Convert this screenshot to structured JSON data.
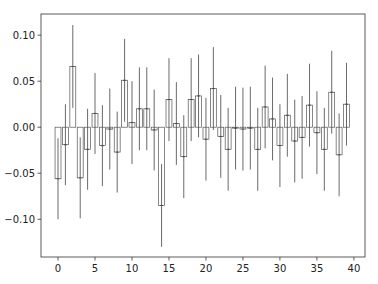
{
  "chart_data": {
    "type": "bar",
    "title": "",
    "xlabel": "",
    "ylabel": "",
    "x": [
      0,
      1,
      2,
      3,
      4,
      5,
      6,
      7,
      8,
      9,
      10,
      11,
      12,
      13,
      14,
      15,
      16,
      17,
      18,
      19,
      20,
      21,
      22,
      23,
      24,
      25,
      26,
      27,
      28,
      29,
      30,
      31,
      32,
      33,
      34,
      35,
      36,
      37,
      38,
      39
    ],
    "values": [
      -0.056,
      -0.019,
      0.066,
      -0.055,
      -0.024,
      0.015,
      -0.02,
      -0.002,
      -0.027,
      0.051,
      0.005,
      0.02,
      0.02,
      -0.003,
      -0.085,
      0.03,
      0.004,
      -0.032,
      0.03,
      0.034,
      -0.013,
      0.042,
      -0.01,
      -0.024,
      -0.001,
      -0.002,
      -0.001,
      -0.024,
      0.022,
      0.009,
      -0.02,
      0.013,
      -0.015,
      -0.011,
      0.024,
      -0.006,
      -0.024,
      0.038,
      -0.03,
      0.025
    ],
    "errors": [
      0.044,
      0.044,
      0.045,
      0.044,
      0.044,
      0.044,
      0.044,
      0.044,
      0.044,
      0.045,
      0.045,
      0.045,
      0.045,
      0.044,
      0.045,
      0.045,
      0.045,
      0.045,
      0.045,
      0.045,
      0.045,
      0.045,
      0.045,
      0.045,
      0.045,
      0.045,
      0.045,
      0.045,
      0.045,
      0.045,
      0.045,
      0.045,
      0.045,
      0.045,
      0.045,
      0.045,
      0.045,
      0.045,
      0.045,
      0.045
    ],
    "xticks": [
      0,
      5,
      10,
      15,
      20,
      25,
      30,
      35,
      40
    ],
    "yticks": [
      -0.1,
      -0.05,
      0.0,
      0.05,
      0.1
    ],
    "ytick_labels": [
      "−0.10",
      "−0.05",
      "0.00",
      "0.05",
      "0.10"
    ],
    "xlim": [
      -2.3,
      41.5
    ],
    "ylim": [
      -0.141,
      0.123
    ],
    "grid": false,
    "bar_fill": "#ffffff",
    "bar_edge": "#555555",
    "error_color": "#444444"
  }
}
